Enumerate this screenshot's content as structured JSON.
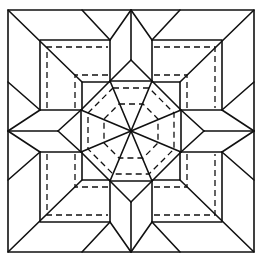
{
  "diagram": {
    "title": "Quilt block pattern: octagonal star with arrow points",
    "stroke_color": "#111111",
    "background": "#ffffff",
    "elements": {
      "outer_square": "solid",
      "inner_square": "solid",
      "central_octagon": "solid",
      "radial_spokes": 8,
      "arrow_points": 4,
      "dashed_seam_lines": "quilting lines"
    }
  }
}
